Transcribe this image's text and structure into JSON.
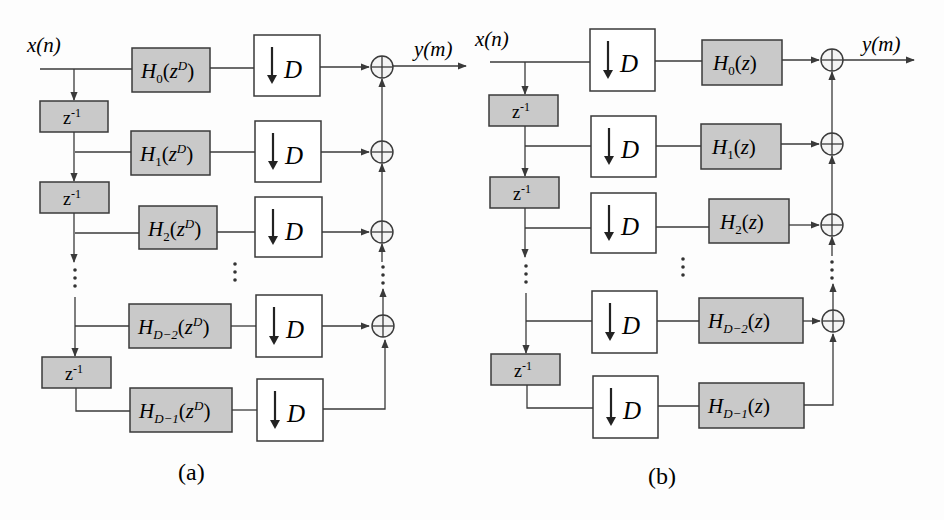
{
  "panels": [
    {
      "id": "a",
      "caption": "(a)",
      "input_label": "x(n)",
      "output_label": "y(m)",
      "structure": "filter-then-decimate",
      "delay_label": "z",
      "delay_exp": "-1",
      "downsampler": {
        "arrow": "↓",
        "factor": "D"
      },
      "branches": [
        {
          "filter_base": "H",
          "filter_sub": "0",
          "filter_arg": "z",
          "filter_arg_exp": "D"
        },
        {
          "filter_base": "H",
          "filter_sub": "1",
          "filter_arg": "z",
          "filter_arg_exp": "D"
        },
        {
          "filter_base": "H",
          "filter_sub": "2",
          "filter_arg": "z",
          "filter_arg_exp": "D"
        },
        {
          "filter_base": "H",
          "filter_sub": "D−2",
          "filter_arg": "z",
          "filter_arg_exp": "D"
        },
        {
          "filter_base": "H",
          "filter_sub": "D−1",
          "filter_arg": "z",
          "filter_arg_exp": "D"
        }
      ]
    },
    {
      "id": "b",
      "caption": "(b)",
      "input_label": "x(n)",
      "output_label": "y(m)",
      "structure": "decimate-then-filter",
      "delay_label": "z",
      "delay_exp": "-1",
      "downsampler": {
        "arrow": "↓",
        "factor": "D"
      },
      "branches": [
        {
          "filter_base": "H",
          "filter_sub": "0",
          "filter_arg": "z"
        },
        {
          "filter_base": "H",
          "filter_sub": "1",
          "filter_arg": "z"
        },
        {
          "filter_base": "H",
          "filter_sub": "2",
          "filter_arg": "z"
        },
        {
          "filter_base": "H",
          "filter_sub": "D−2",
          "filter_arg": "z"
        },
        {
          "filter_base": "H",
          "filter_sub": "D−1",
          "filter_arg": "z"
        }
      ]
    }
  ],
  "colors": {
    "filter_fill": "#c9c9c9",
    "stroke": "#3a3a3a",
    "background": "#fdfdfd"
  }
}
